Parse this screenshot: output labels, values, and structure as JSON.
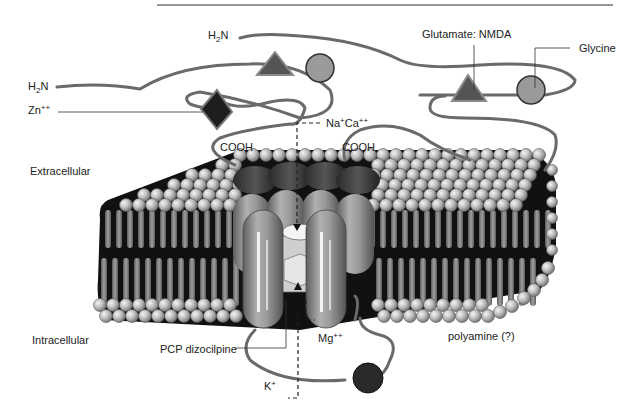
{
  "diagram": {
    "regions": {
      "extracellular": "Extracellular",
      "intracellular": "Intracellular"
    },
    "terminals": {
      "n_terminus_1": {
        "base": "H",
        "sub": "2",
        "rest": "N"
      },
      "n_terminus_2": {
        "base": "H",
        "sub": "2",
        "rest": "N"
      },
      "c_terminus_1": "COOH",
      "c_terminus_2": "COOH"
    },
    "ions": {
      "zinc": {
        "base": "Zn",
        "sup": "++"
      },
      "sodium": {
        "base": "Na",
        "sup": "+"
      },
      "calcium": {
        "base": "Ca",
        "sup": "++"
      },
      "magnesium": {
        "base": "Mg",
        "sup": "++"
      },
      "potassium": {
        "base": "K",
        "sup": "+"
      }
    },
    "binding_sites": {
      "glutamate": "Glutamate: NMDA",
      "glycine": "Glycine",
      "pcp": "PCP dizocilpine",
      "polyamine": "polyamine (?)"
    },
    "colors": {
      "triangle": "#555555",
      "circle": "#9a9a9a",
      "diamond": "#1e1e1e",
      "dark_circle": "#2a2a2a",
      "chain": "#6a6a6a",
      "lipid_head": "#b8b8b8",
      "lipid_tail": "#8a8a8a",
      "membrane_core": "#111111",
      "cylinder": "#9c9c9c"
    }
  }
}
